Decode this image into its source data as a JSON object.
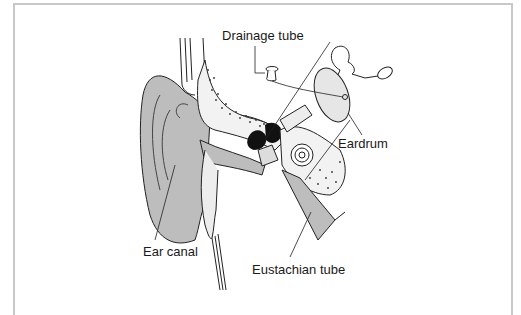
{
  "diagram": {
    "labels": {
      "drainage_tube": "Drainage tube",
      "eardrum": "Eardrum",
      "ear_canal": "Ear canal",
      "eustachian_tube": "Eustachian tube"
    },
    "colors": {
      "tissue_gray": "#bdbdbd",
      "light_fill": "#ededed",
      "line": "#222222",
      "frame": "#c8c8c8"
    }
  }
}
